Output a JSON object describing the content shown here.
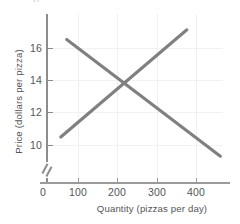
{
  "figure": {
    "top_partial_text": "p",
    "background": "#ffffff",
    "curve_color": "#808082",
    "axis_color": "#8d8d8f",
    "grid_color": "#f0f0f0",
    "text_color": "#555557"
  },
  "chart_data": {
    "type": "line",
    "title": "",
    "xlabel": "Quantity (pizzas per day)",
    "ylabel": "Price (dollars per pizza)",
    "xlim": [
      0,
      460
    ],
    "ylim": [
      9,
      17.6
    ],
    "y_axis_break": true,
    "grid": true,
    "legend": "none",
    "xticks": [
      0,
      100,
      200,
      300,
      400
    ],
    "xtick_labels": [
      "0",
      "100",
      "200",
      "300",
      "400"
    ],
    "yticks": [
      10,
      12,
      14,
      16
    ],
    "ytick_labels": [
      "10",
      "12",
      "14",
      "16"
    ],
    "series": [
      {
        "name": "Demand",
        "type": "line",
        "color": "#808082",
        "x": [
          50,
          440
        ],
        "y": [
          16.6,
          9.3
        ]
      },
      {
        "name": "Supply",
        "type": "line",
        "color": "#808082",
        "x": [
          35,
          355
        ],
        "y": [
          10.5,
          17.2
        ]
      }
    ],
    "equilibrium": {
      "quantity": 200,
      "price": 14
    }
  },
  "ticks": {
    "y": [
      {
        "label": "16",
        "value": 16
      },
      {
        "label": "14",
        "value": 14
      },
      {
        "label": "12",
        "value": 12
      },
      {
        "label": "10",
        "value": 10
      }
    ],
    "x": [
      {
        "label": "0",
        "value": 0
      },
      {
        "label": "100",
        "value": 100
      },
      {
        "label": "200",
        "value": 200
      },
      {
        "label": "300",
        "value": 300
      },
      {
        "label": "400",
        "value": 400
      }
    ]
  }
}
